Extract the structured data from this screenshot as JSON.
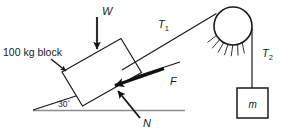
{
  "diagram": {
    "type": "free-body-diagram",
    "background_color": "#ffffff",
    "line_color": "#1a1a1a",
    "ground_color": "#8c8c8c",
    "labels": {
      "block_mass": "100 kg block",
      "weight": "W",
      "tension_incline": "T",
      "tension_incline_sub": "1",
      "tension_hanging": "T",
      "tension_hanging_sub": "2",
      "friction": "F",
      "normal": "N",
      "angle": "30",
      "angle_unit": "°",
      "hanging_mass": "m"
    },
    "elements": {
      "ground": {
        "name": "horizontal-ground-line",
        "x1": 33,
        "y1": 110,
        "x2": 185,
        "y2": 110
      },
      "incline": {
        "name": "incline-surface",
        "x1": 33,
        "y1": 110,
        "x2": 180,
        "y2": 62,
        "angle_deg": 30
      },
      "block": {
        "name": "block-on-incline",
        "corners": "62,72 121,38 141,72 82,106"
      },
      "rope_t1": {
        "name": "rope-t1",
        "x1": 122,
        "y1": 70,
        "x2": 216,
        "y2": 13
      },
      "pulley": {
        "name": "pulley-wheel",
        "cx": 233,
        "cy": 26,
        "r": 19
      },
      "rope_t2": {
        "name": "rope-t2",
        "x1": 252,
        "y1": 28,
        "x2": 252,
        "y2": 87
      },
      "hanging_box": {
        "name": "hanging-mass-box",
        "x": 237,
        "y": 87,
        "w": 31,
        "h": 30
      },
      "arrow_w": {
        "name": "weight-force-arrow",
        "x1": 97,
        "y1": 17,
        "x2": 97,
        "y2": 54
      },
      "arrow_f": {
        "name": "friction-force-arrow",
        "x1": 163,
        "y1": 69,
        "x2": 110,
        "y2": 87
      },
      "arrow_n": {
        "name": "normal-force-arrow",
        "x1": 140,
        "y1": 118,
        "x2": 114,
        "y2": 86
      },
      "arrow_block_label": {
        "name": "block-label-arrow",
        "x1": 52,
        "y1": 54,
        "x2": 68,
        "y2": 68
      }
    },
    "label_positions": {
      "block_mass": {
        "x": 4,
        "y": 53
      },
      "weight": {
        "x": 103,
        "y": 17
      },
      "tension_incline": {
        "x": 159,
        "y": 26
      },
      "tension_hanging": {
        "x": 263,
        "y": 55
      },
      "friction": {
        "x": 172,
        "y": 83
      },
      "normal": {
        "x": 144,
        "y": 126
      },
      "angle": {
        "x": 58,
        "y": 106
      },
      "hanging_mass": {
        "x": 248,
        "y": 107
      }
    }
  }
}
